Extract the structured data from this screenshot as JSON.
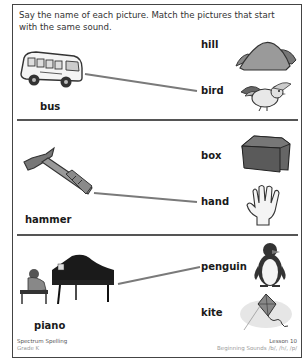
{
  "instructions": "Say the name of each picture. Match the pictures that start with the same sound.",
  "sections": [
    {
      "left": {
        "word": "bus",
        "icon": "bus-icon"
      },
      "right": [
        {
          "word": "hill",
          "icon": "hill-icon"
        },
        {
          "word": "bird",
          "icon": "bird-icon"
        }
      ],
      "match": "bird"
    },
    {
      "left": {
        "word": "hammer",
        "icon": "hammer-icon"
      },
      "right": [
        {
          "word": "box",
          "icon": "box-icon"
        },
        {
          "word": "hand",
          "icon": "hand-icon"
        }
      ],
      "match": "hand"
    },
    {
      "left": {
        "word": "piano",
        "icon": "piano-icon"
      },
      "right": [
        {
          "word": "penguin",
          "icon": "penguin-icon"
        },
        {
          "word": "kite",
          "icon": "kite-icon"
        }
      ],
      "match": "penguin"
    }
  ],
  "footer": {
    "left_title": "Spectrum Spelling",
    "left_sub": "Grade K",
    "right_title": "Lesson 10",
    "right_sub": "Beginning Sounds /b/, /h/, /p/"
  },
  "colors": {
    "line": "#7a7a7a",
    "border": "#444444"
  }
}
